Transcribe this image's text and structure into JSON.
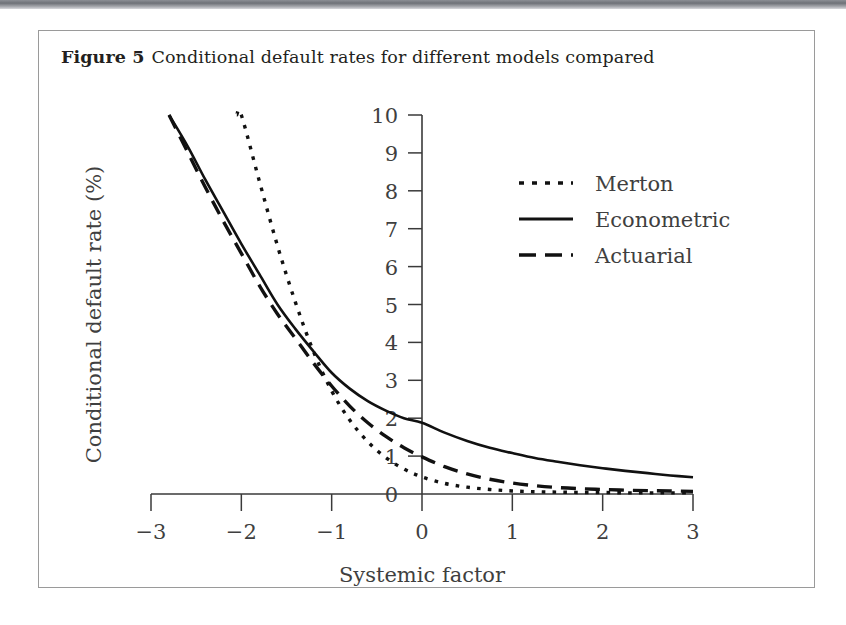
{
  "page": {
    "top_rule_color": "#6e7177",
    "figure_border_color": "#9a9a9a",
    "background": "#ffffff"
  },
  "figure": {
    "label": "Figure 5",
    "caption": "Conditional default rates for different models compared"
  },
  "chart_data": {
    "type": "line",
    "title": "",
    "xlabel": "Systemic factor",
    "ylabel": "Conditional default rate (%)",
    "xlim": [
      -3,
      3
    ],
    "ylim": [
      0,
      10
    ],
    "xticks": [
      -3,
      -2,
      -1,
      0,
      1,
      2,
      3
    ],
    "xtick_labels": [
      "−3",
      "−2",
      "−1",
      "0",
      "1",
      "2",
      "3"
    ],
    "yticks": [
      0,
      1,
      2,
      3,
      4,
      5,
      6,
      7,
      8,
      9,
      10
    ],
    "ytick_labels": [
      "0",
      "1",
      "2",
      "3",
      "4",
      "5",
      "6",
      "7",
      "8",
      "9",
      "10"
    ],
    "grid": false,
    "legend_position": "upper right",
    "axis_style": "y-axis drawn at x = 0, ticks outward",
    "x": [
      -3.0,
      -2.8,
      -2.6,
      -2.4,
      -2.2,
      -2.0,
      -1.8,
      -1.6,
      -1.4,
      -1.2,
      -1.0,
      -0.8,
      -0.6,
      -0.4,
      -0.2,
      0.0,
      0.25,
      0.5,
      0.75,
      1.0,
      1.25,
      1.5,
      1.75,
      2.0,
      2.25,
      2.5,
      2.75,
      3.0
    ],
    "series": [
      {
        "name": "Merton",
        "style": "dotted",
        "color": "#111111",
        "x_start": -2.05,
        "values": [
          null,
          null,
          null,
          null,
          null,
          10.0,
          8.25,
          6.55,
          5.05,
          3.75,
          2.72,
          1.95,
          1.38,
          0.96,
          0.66,
          0.45,
          0.28,
          0.18,
          0.12,
          0.08,
          0.06,
          0.05,
          0.04,
          0.04,
          0.03,
          0.03,
          0.03,
          0.03
        ]
      },
      {
        "name": "Econometric",
        "style": "solid",
        "color": "#111111",
        "x_start": -2.72,
        "values": [
          null,
          10.0,
          9.2,
          8.3,
          7.45,
          6.6,
          5.8,
          5.0,
          4.35,
          3.76,
          3.2,
          2.78,
          2.45,
          2.2,
          2.0,
          1.88,
          1.62,
          1.4,
          1.22,
          1.08,
          0.95,
          0.85,
          0.76,
          0.68,
          0.61,
          0.55,
          0.49,
          0.44
        ]
      },
      {
        "name": "Actuarial",
        "style": "dashed",
        "color": "#111111",
        "x_start": -2.78,
        "values": [
          null,
          10.0,
          9.05,
          8.1,
          7.2,
          6.35,
          5.5,
          4.75,
          4.1,
          3.45,
          2.85,
          2.32,
          1.88,
          1.52,
          1.22,
          0.98,
          0.72,
          0.53,
          0.39,
          0.29,
          0.22,
          0.17,
          0.14,
          0.12,
          0.1,
          0.09,
          0.08,
          0.07
        ]
      }
    ],
    "legend": [
      {
        "label": "Merton",
        "style": "dotted"
      },
      {
        "label": "Econometric",
        "style": "solid"
      },
      {
        "label": "Actuarial",
        "style": "dashed"
      }
    ]
  }
}
